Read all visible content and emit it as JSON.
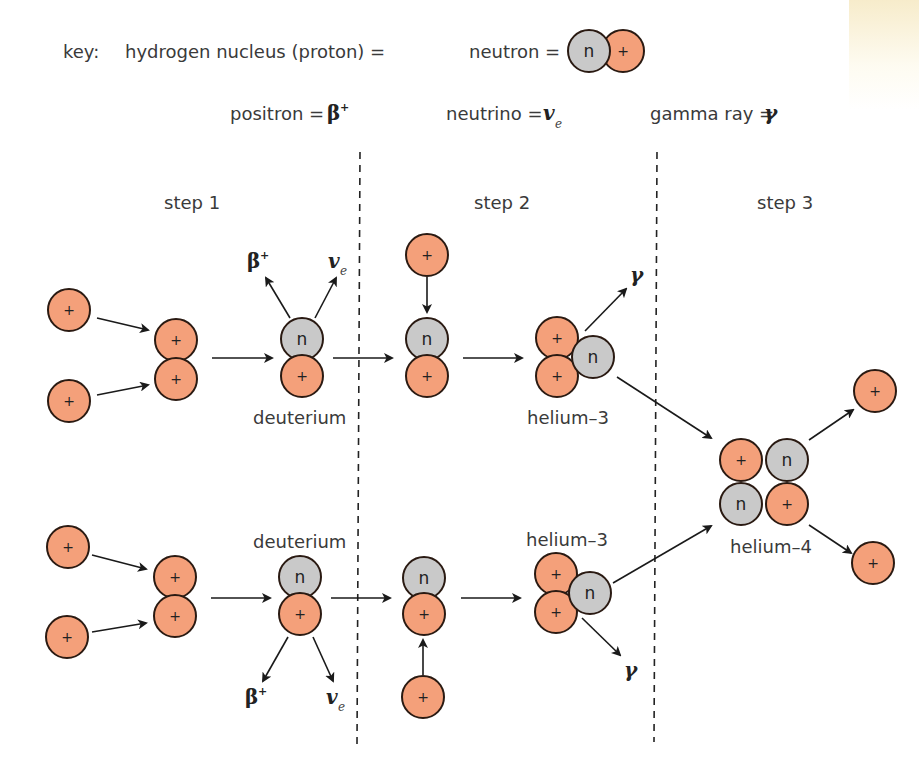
{
  "colors": {
    "proton_fill": "#f4a07a",
    "neutron_fill": "#c9c9c9",
    "outline": "#2a1a12",
    "text": "#3a3a3a"
  },
  "key": {
    "label": "key:",
    "proton_label": "hydrogen nucleus (proton) =",
    "proton_glyph": "+",
    "neutron_label": "neutron =",
    "neutron_glyph": "n",
    "positron_label": "positron =",
    "positron_symbol": "β",
    "positron_sup": "+",
    "neutrino_label": "neutrino =",
    "neutrino_symbol": "v",
    "neutrino_sub": "e",
    "gamma_label": "gamma ray =",
    "gamma_symbol": "γ"
  },
  "steps": [
    "step 1",
    "step 2",
    "step 3"
  ],
  "labels": {
    "deuterium_top": "deuterium",
    "deuterium_bottom": "deuterium",
    "helium3_top": "helium–3",
    "helium3_bottom": "helium–3",
    "helium4": "helium–4"
  },
  "emissions": {
    "beta_top": "β",
    "beta_top_sup": "+",
    "nu_top": "v",
    "nu_top_sub": "e",
    "gamma_top": "γ",
    "beta_bottom": "β",
    "beta_bottom_sup": "+",
    "nu_bottom": "v",
    "nu_bottom_sub": "e",
    "gamma_bottom": "γ"
  },
  "particles": [
    {
      "type": "p",
      "x": 623,
      "y": 51
    },
    {
      "type": "n",
      "x": 589,
      "y": 51
    },
    {
      "type": "p",
      "x": 69,
      "y": 310
    },
    {
      "type": "p",
      "x": 69,
      "y": 401
    },
    {
      "type": "p",
      "x": 176,
      "y": 340
    },
    {
      "type": "p",
      "x": 176,
      "y": 379
    },
    {
      "type": "n",
      "x": 302,
      "y": 339
    },
    {
      "type": "p",
      "x": 302,
      "y": 376
    },
    {
      "type": "p",
      "x": 427,
      "y": 255
    },
    {
      "type": "n",
      "x": 427,
      "y": 339
    },
    {
      "type": "p",
      "x": 427,
      "y": 376
    },
    {
      "type": "p",
      "x": 557,
      "y": 338
    },
    {
      "type": "p",
      "x": 557,
      "y": 376
    },
    {
      "type": "n",
      "x": 593,
      "y": 357
    },
    {
      "type": "p",
      "x": 741,
      "y": 460
    },
    {
      "type": "n",
      "x": 787,
      "y": 460
    },
    {
      "type": "n",
      "x": 741,
      "y": 504
    },
    {
      "type": "p",
      "x": 787,
      "y": 504
    },
    {
      "type": "p",
      "x": 875,
      "y": 391
    },
    {
      "type": "p",
      "x": 873,
      "y": 563
    },
    {
      "type": "p",
      "x": 68,
      "y": 547
    },
    {
      "type": "p",
      "x": 67,
      "y": 637
    },
    {
      "type": "p",
      "x": 175,
      "y": 577
    },
    {
      "type": "p",
      "x": 175,
      "y": 616
    },
    {
      "type": "n",
      "x": 300,
      "y": 577
    },
    {
      "type": "p",
      "x": 300,
      "y": 614
    },
    {
      "type": "n",
      "x": 424,
      "y": 578
    },
    {
      "type": "p",
      "x": 424,
      "y": 614
    },
    {
      "type": "p",
      "x": 423,
      "y": 697
    },
    {
      "type": "p",
      "x": 556,
      "y": 574
    },
    {
      "type": "p",
      "x": 556,
      "y": 612
    },
    {
      "type": "n",
      "x": 590,
      "y": 593
    }
  ],
  "arrows": [
    {
      "x1": 97,
      "y1": 318,
      "x2": 148,
      "y2": 330
    },
    {
      "x1": 97,
      "y1": 395,
      "x2": 148,
      "y2": 385
    },
    {
      "x1": 212,
      "y1": 358,
      "x2": 272,
      "y2": 358
    },
    {
      "x1": 290,
      "y1": 318,
      "x2": 266,
      "y2": 278
    },
    {
      "x1": 315,
      "y1": 318,
      "x2": 336,
      "y2": 278
    },
    {
      "x1": 333,
      "y1": 358,
      "x2": 392,
      "y2": 358
    },
    {
      "x1": 427,
      "y1": 277,
      "x2": 427,
      "y2": 312
    },
    {
      "x1": 463,
      "y1": 358,
      "x2": 522,
      "y2": 358
    },
    {
      "x1": 585,
      "y1": 331,
      "x2": 626,
      "y2": 289
    },
    {
      "x1": 617,
      "y1": 377,
      "x2": 711,
      "y2": 438
    },
    {
      "x1": 809,
      "y1": 440,
      "x2": 853,
      "y2": 410
    },
    {
      "x1": 809,
      "y1": 525,
      "x2": 851,
      "y2": 553
    },
    {
      "x1": 92,
      "y1": 555,
      "x2": 146,
      "y2": 569
    },
    {
      "x1": 92,
      "y1": 632,
      "x2": 146,
      "y2": 623
    },
    {
      "x1": 211,
      "y1": 598,
      "x2": 270,
      "y2": 598
    },
    {
      "x1": 288,
      "y1": 637,
      "x2": 263,
      "y2": 681
    },
    {
      "x1": 313,
      "y1": 637,
      "x2": 333,
      "y2": 681
    },
    {
      "x1": 331,
      "y1": 598,
      "x2": 390,
      "y2": 598
    },
    {
      "x1": 423,
      "y1": 675,
      "x2": 423,
      "y2": 640
    },
    {
      "x1": 461,
      "y1": 598,
      "x2": 520,
      "y2": 598
    },
    {
      "x1": 613,
      "y1": 583,
      "x2": 711,
      "y2": 526
    },
    {
      "x1": 582,
      "y1": 618,
      "x2": 620,
      "y2": 655
    }
  ]
}
